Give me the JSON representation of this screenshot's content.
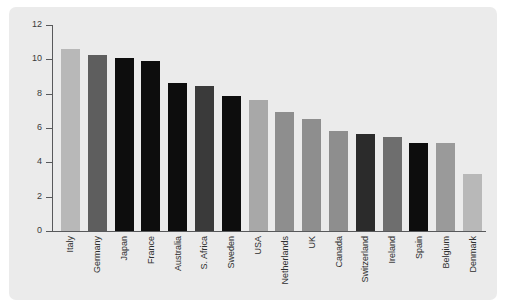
{
  "figure": {
    "panel_bg": "#ebebeb",
    "page_bg": "#ffffff",
    "axis_color": "#58595b",
    "tick_label_color": "#3a3a3a"
  },
  "chart_data": {
    "type": "bar",
    "title": "",
    "subtitle": "",
    "xlabel": "",
    "ylabel": "",
    "ylim": [
      0,
      12
    ],
    "yticks": [
      0,
      2,
      4,
      6,
      8,
      10,
      12
    ],
    "ytick_labels": [
      "0",
      "2",
      "4",
      "6",
      "8",
      "10",
      "12"
    ],
    "grid": false,
    "legend": "none",
    "categories": [
      "Italy",
      "Germany",
      "Japan",
      "France",
      "Australia",
      "S. Africa",
      "Sweden",
      "USA",
      "Netherlands",
      "UK",
      "Canada",
      "Switzerland",
      "Ireland",
      "Spain",
      "Belgium",
      "Denmark"
    ],
    "values": [
      10.6,
      10.25,
      10.1,
      9.9,
      8.65,
      8.45,
      7.85,
      7.65,
      6.95,
      6.5,
      5.8,
      5.65,
      5.5,
      5.1,
      5.1,
      3.3
    ],
    "bar_colors": [
      "#b8b8b8",
      "#5e5e5e",
      "#0d0d0d",
      "#0d0d0d",
      "#0d0d0d",
      "#3a3a3a",
      "#0d0d0d",
      "#a8a8a8",
      "#8e8e8e",
      "#8e8e8e",
      "#8e8e8e",
      "#2b2b2b",
      "#6e6e6e",
      "#0d0d0d",
      "#9a9a9a",
      "#b8b8b8"
    ]
  }
}
